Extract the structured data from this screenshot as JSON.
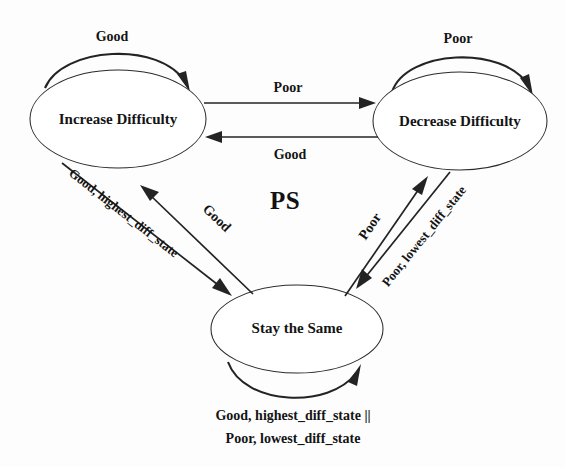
{
  "diagram": {
    "title": "PS",
    "background_color": "#fdfdfd",
    "stroke_color": "#232323",
    "states": [
      {
        "id": "increase",
        "label": "Increase Difficulty",
        "cx": 118,
        "cy": 119,
        "rx": 88,
        "ry": 49
      },
      {
        "id": "decrease",
        "label": "Decrease Difficulty",
        "cx": 460,
        "cy": 121,
        "rx": 87,
        "ry": 49
      },
      {
        "id": "stay",
        "label": "Stay the Same",
        "cx": 297,
        "cy": 329,
        "rx": 86,
        "ry": 44
      }
    ],
    "transitions": [
      {
        "id": "increase-self",
        "from": "increase",
        "to": "increase",
        "label": "Good"
      },
      {
        "id": "decrease-self",
        "from": "decrease",
        "to": "decrease",
        "label": "Poor"
      },
      {
        "id": "increase-to-decrease",
        "from": "increase",
        "to": "decrease",
        "label": "Poor"
      },
      {
        "id": "decrease-to-increase",
        "from": "decrease",
        "to": "increase",
        "label": "Good"
      },
      {
        "id": "increase-to-stay",
        "from": "increase",
        "to": "stay",
        "label": "Good, highest_diff_state"
      },
      {
        "id": "stay-to-increase",
        "from": "stay",
        "to": "increase",
        "label": "Good"
      },
      {
        "id": "stay-to-decrease",
        "from": "stay",
        "to": "decrease",
        "label": "Poor"
      },
      {
        "id": "decrease-to-stay",
        "from": "decrease",
        "to": "stay",
        "label": "Poor, lowest_diff_state"
      },
      {
        "id": "stay-self",
        "from": "stay",
        "to": "stay",
        "label_line1": "Good, highest_diff_state ||",
        "label_line2": "Poor, lowest_diff_state"
      }
    ]
  }
}
